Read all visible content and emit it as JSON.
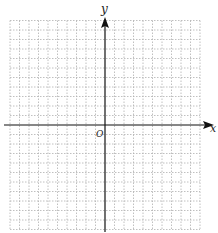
{
  "diagram": {
    "type": "coordinate-plane",
    "axes": {
      "x_label": "x",
      "y_label": "y",
      "origin_label": "O"
    },
    "grid": {
      "columns_left_of_origin": 10,
      "columns_right_of_origin": 10,
      "rows_above_origin": 11,
      "rows_below_origin": 11,
      "line_style": "dotted",
      "line_color": "#b0b0b0"
    },
    "colors": {
      "axis": "#111111",
      "background": "#ffffff"
    }
  }
}
